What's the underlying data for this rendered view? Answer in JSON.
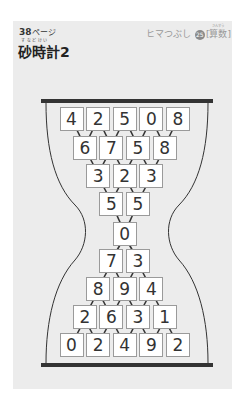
{
  "header": {
    "page_number": "38",
    "page_unit": "ページ",
    "series_label": "ヒマつぶし",
    "series_number": "25",
    "subject": "[算数]",
    "subject_ruby": "さんすう",
    "title_ruby": "すなどけい",
    "title": "砂時計2"
  },
  "puzzle": {
    "rows": [
      {
        "cells": [
          "4",
          "2",
          "5",
          "0",
          "8"
        ],
        "direction": "down"
      },
      {
        "cells": [
          "6",
          "7",
          "5",
          "8"
        ],
        "direction": "down"
      },
      {
        "cells": [
          "3",
          "2",
          "3"
        ],
        "direction": "down"
      },
      {
        "cells": [
          "5",
          "5"
        ],
        "direction": "down"
      },
      {
        "cells": [
          "0"
        ],
        "direction": "center"
      },
      {
        "cells": [
          "7",
          "3"
        ],
        "direction": "up"
      },
      {
        "cells": [
          "8",
          "9",
          "4"
        ],
        "direction": "up"
      },
      {
        "cells": [
          "2",
          "6",
          "3",
          "1"
        ],
        "direction": "up"
      },
      {
        "cells": [
          "0",
          "2",
          "4",
          "9",
          "2"
        ],
        "direction": "up"
      }
    ]
  },
  "colors": {
    "card": "#ececec",
    "bar": "#333333",
    "box_border": "#9a9a9a",
    "arrow": "#333333"
  }
}
